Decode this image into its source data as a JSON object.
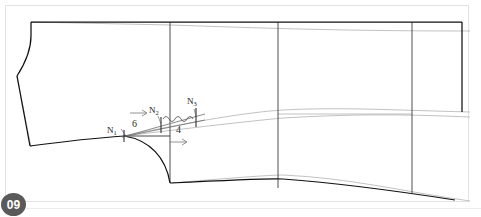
{
  "page": {
    "badge_number": "09",
    "background_color": "#ffffff",
    "frame_color": "#e2e2e2",
    "ink_color": "#1a1a1a",
    "construction_color": "#9a9a9a"
  },
  "diagram": {
    "type": "technical-pattern-drawing",
    "notches": [
      {
        "id": "N1",
        "base": "N",
        "sub": "1",
        "x": 115,
        "y": 131,
        "point_x": 124,
        "point_y": 136
      },
      {
        "id": "N2",
        "base": "N",
        "sub": "2",
        "x": 155,
        "y": 113,
        "point_x": 161,
        "point_y": 125
      },
      {
        "id": "N3",
        "base": "N",
        "sub": "3",
        "x": 192,
        "y": 104,
        "point_x": 196,
        "point_y": 117
      }
    ],
    "dimensions": [
      {
        "value": "6",
        "x": 136,
        "y": 127,
        "arrow_x1": 131,
        "arrow_y1": 114,
        "arrow_x2": 145,
        "arrow_y2": 114
      },
      {
        "value": "4",
        "x": 180,
        "y": 131,
        "arrow_x1": 172,
        "arrow_y1": 142,
        "arrow_x2": 186,
        "arrow_y2": 142
      }
    ],
    "vertical_guides": [
      {
        "name": "guide-1",
        "x": 170
      },
      {
        "name": "guide-2",
        "x": 278
      },
      {
        "name": "guide-3",
        "x": 412
      }
    ],
    "notes": {
      "wave_segment": "ease-distribution-wave between N2 and N3",
      "left_edge": "curved armhole / neckline profile",
      "bottom_edge": "sloped hemline with curved scye"
    }
  }
}
